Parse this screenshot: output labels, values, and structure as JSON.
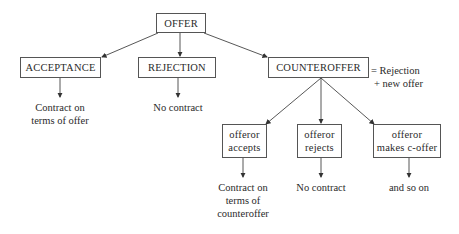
{
  "diagram": {
    "root": {
      "label": "OFFER"
    },
    "level1": [
      {
        "label": "ACCEPTANCE",
        "outcome": [
          "Contract on",
          "terms of offer"
        ]
      },
      {
        "label": "REJECTION",
        "outcome": [
          "No contract"
        ]
      },
      {
        "label": "COUNTEROFFER",
        "note": [
          "= Rejection",
          "+ new offer"
        ]
      }
    ],
    "level2": [
      {
        "lines": [
          "offeror",
          "accepts"
        ],
        "outcome": [
          "Contract on",
          "terms of",
          "counteroffer"
        ]
      },
      {
        "lines": [
          "offeror",
          "rejects"
        ],
        "outcome": [
          "No contract"
        ]
      },
      {
        "lines": [
          "offeror",
          "makes c-offer"
        ],
        "outcome": [
          "and so on"
        ]
      }
    ]
  }
}
